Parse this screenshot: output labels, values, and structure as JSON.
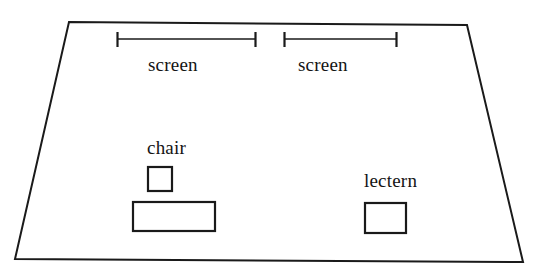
{
  "diagram": {
    "canvas": {
      "width": 546,
      "height": 278
    },
    "colors": {
      "background": "#ffffff",
      "stroke": "#1a1a1a",
      "text": "#141414"
    },
    "room": {
      "name": "room-outline",
      "shape": "trapezoid",
      "points": "69,22 467,25 523,262 15,259"
    },
    "dimension_lines": [
      {
        "name": "screen-left-dimension",
        "label": "screen",
        "x1": 117,
        "x2": 256,
        "y": 39,
        "tick_top": 32,
        "tick_bottom": 47
      },
      {
        "name": "screen-right-dimension",
        "label": "screen",
        "x1": 284,
        "x2": 397,
        "y": 39,
        "tick_top": 32,
        "tick_bottom": 47
      }
    ],
    "furniture": [
      {
        "name": "chair",
        "label": "chair",
        "shape": "square",
        "x": 148,
        "y": 167,
        "width": 24,
        "height": 24
      },
      {
        "name": "table",
        "label": "",
        "shape": "rectangle",
        "x": 133,
        "y": 202,
        "width": 82,
        "height": 29
      },
      {
        "name": "lectern",
        "label": "lectern",
        "shape": "rectangle",
        "x": 365,
        "y": 203,
        "width": 41,
        "height": 30
      }
    ],
    "labels": {
      "screen_left": "screen",
      "screen_right": "screen",
      "chair": "chair",
      "lectern": "lectern"
    }
  }
}
